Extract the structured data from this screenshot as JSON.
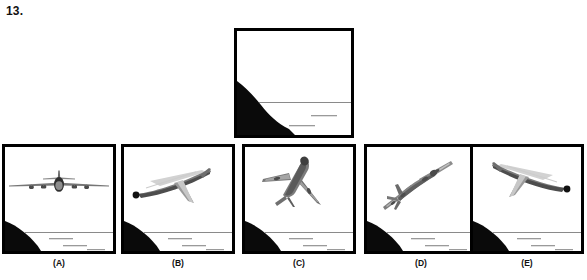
{
  "question": {
    "number": "13."
  },
  "colors": {
    "ink": "#000000",
    "terrain": "#0a0a0a",
    "horizon_line": "#8a8a8a",
    "water_dash": "#9a9a9a",
    "plane_body": "#8f8f8f",
    "plane_shade": "#5c5c5c",
    "plane_dark": "#2a2a2a",
    "background": "#ffffff",
    "frame": "#000000"
  },
  "reference": {
    "name": "reference-view",
    "description": "Black hillside slope descending from upper left to lower right, horizon line, water with two dashes",
    "terrain": {
      "slope_from": "upper-left",
      "slope_to": "lower-right",
      "horizon_y_frac": 0.62,
      "dashes": 2
    }
  },
  "options": [
    {
      "id": "a",
      "label": "(A)",
      "plane_name": "airplane-front-view",
      "orientation": "head-on level flight, wings horizontal, four engines visible",
      "rotation_deg": 0,
      "dashes": 3
    },
    {
      "id": "b",
      "label": "(B)",
      "plane_name": "airplane-rear-quarter-left-view",
      "orientation": "receding, nose low to the left, tail fin right, dark nose dot at left",
      "rotation_deg": -20,
      "dashes": 3
    },
    {
      "id": "c",
      "label": "(C)",
      "plane_name": "airplane-steep-climb-underside-view",
      "orientation": "steep climb seen from below, nose up toward upper right",
      "rotation_deg": 55,
      "dashes": 3
    },
    {
      "id": "d",
      "label": "(D)",
      "plane_name": "airplane-banked-diagonal-view",
      "orientation": "banked diagonal, nose toward upper right, wings along diagonal axis",
      "rotation_deg": -35,
      "dashes": 3
    },
    {
      "id": "e",
      "label": "(E)",
      "plane_name": "airplane-rear-quarter-right-view",
      "orientation": "receding, nose high to the right, tail fin left, dark nose dot at upper right",
      "rotation_deg": 20,
      "dashes": 3
    }
  ]
}
